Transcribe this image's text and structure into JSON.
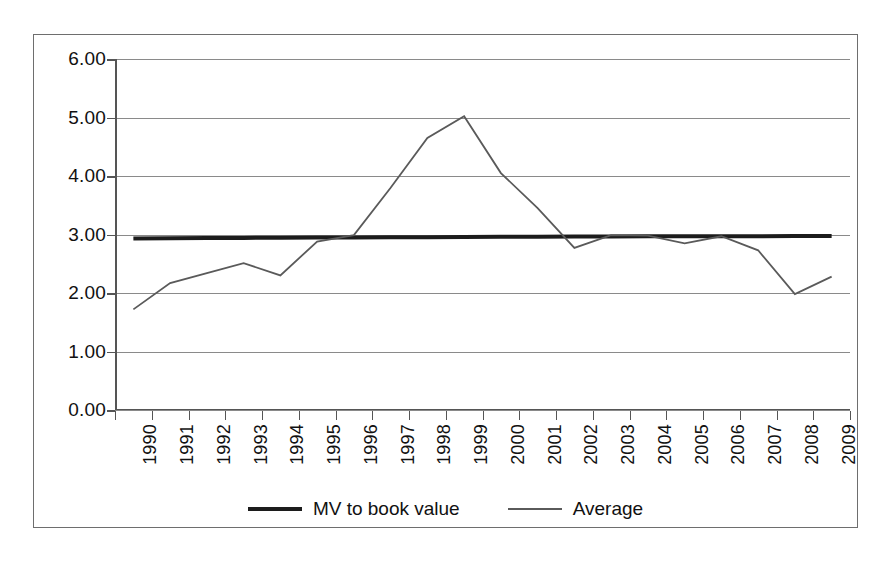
{
  "chart_data": {
    "type": "line",
    "title": "",
    "xlabel": "",
    "ylabel": "",
    "ylim": [
      0,
      6
    ],
    "ytick_step": 1,
    "grid": true,
    "legend_position": "bottom",
    "categories": [
      "1990",
      "1991",
      "1992",
      "1993",
      "1994",
      "1995",
      "1996",
      "1997",
      "1998",
      "1999",
      "2000",
      "2001",
      "2002",
      "2003",
      "2004",
      "2005",
      "2006",
      "2007",
      "2008",
      "2009"
    ],
    "ytick_labels": [
      "6.00",
      "5.00",
      "4.00",
      "3.00",
      "2.00",
      "1.00",
      "0.00"
    ],
    "ytick_values": [
      6,
      5,
      4,
      3,
      2,
      1,
      0
    ],
    "series": [
      {
        "name": "MV to book value",
        "style": "thick-straight-trend",
        "color": "#1c1c1c",
        "width": 4,
        "values": [
          2.93,
          2.935,
          2.94,
          2.942,
          2.945,
          2.948,
          2.95,
          2.952,
          2.955,
          2.957,
          2.96,
          2.962,
          2.964,
          2.966,
          2.968,
          2.97,
          2.971,
          2.972,
          2.973,
          2.974
        ]
      },
      {
        "name": "Average",
        "style": "thin-line",
        "color": "#5a5a5a",
        "width": 1.8,
        "values": [
          1.72,
          2.17,
          2.34,
          2.51,
          2.3,
          2.88,
          2.99,
          3.8,
          4.65,
          5.02,
          4.05,
          3.45,
          2.77,
          2.99,
          2.98,
          2.85,
          2.97,
          2.73,
          1.98,
          2.28
        ]
      }
    ]
  },
  "legend": {
    "entries": [
      {
        "label": "MV to book value",
        "swatch": "thick-line-swatch"
      },
      {
        "label": "Average",
        "swatch": "thin-line-swatch"
      }
    ]
  }
}
